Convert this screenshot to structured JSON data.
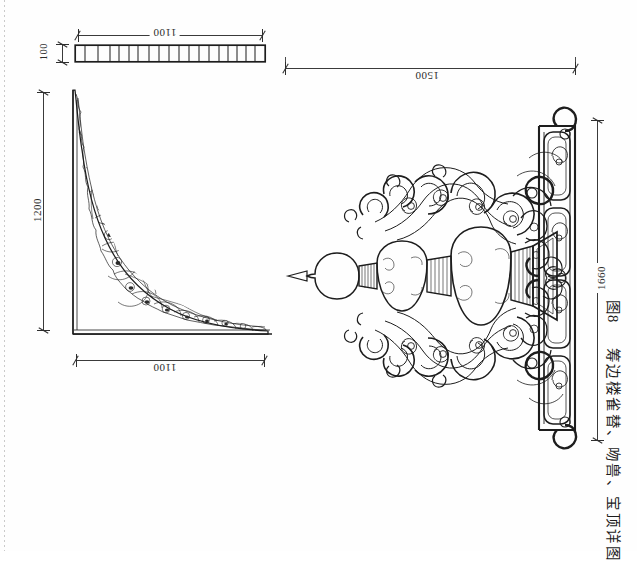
{
  "sheet": {
    "title": "图8 筹边楼雀替、吻兽、宝顶详图",
    "caption_figure_number": "图8",
    "caption_text": "筹边楼雀替、吻兽、宝顶详图",
    "background_color": "#fefefe",
    "line_color": "#1d1d1d"
  },
  "views": {
    "top_bar": {
      "name": "构件平面条带",
      "segment_count": 19,
      "dimensions": {
        "width_label": "1100",
        "height_label": "100"
      }
    },
    "bracket": {
      "name": "雀替立面",
      "dimensions": {
        "height_label": "1200",
        "width_label": "1100"
      }
    },
    "finial": {
      "name": "宝顶吻兽详图",
      "dimensions": {
        "width_label": "1500",
        "height_label": "1660"
      }
    }
  },
  "dimensions": [
    {
      "id": "top-bar-width",
      "value": "1100",
      "rotation": 180
    },
    {
      "id": "top-bar-height",
      "value": "100",
      "rotation": 90
    },
    {
      "id": "bracket-height",
      "value": "1200",
      "rotation": 90
    },
    {
      "id": "bracket-width",
      "value": "1100",
      "rotation": 180
    },
    {
      "id": "finial-width",
      "value": "1500",
      "rotation": 180
    },
    {
      "id": "finial-height",
      "value": "1660",
      "rotation": 90
    }
  ]
}
